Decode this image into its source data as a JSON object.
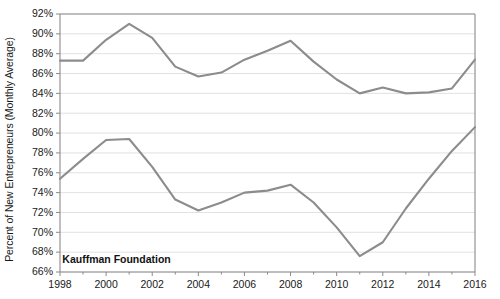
{
  "chart_data": {
    "type": "line",
    "title": "",
    "subtitle": "",
    "xlabel": "",
    "ylabel": "Percent of New Entrepreneurs (Monthly Average)",
    "xlim": [
      1998,
      2016
    ],
    "ylim": [
      66,
      92
    ],
    "ytick_step": 2,
    "xtick_step": 2,
    "grid": "horizontal",
    "legend_position": "none",
    "y_tick_labels": [
      "92%",
      "90%",
      "88%",
      "86%",
      "84%",
      "82%",
      "80%",
      "78%",
      "76%",
      "74%",
      "72%",
      "70%",
      "68%",
      "66%"
    ],
    "y_tick_values": [
      92,
      90,
      88,
      86,
      84,
      82,
      80,
      78,
      76,
      74,
      72,
      70,
      68,
      66
    ],
    "x_tick_labels": [
      "1998",
      "2000",
      "2002",
      "2004",
      "2006",
      "2008",
      "2010",
      "2012",
      "2014",
      "2016"
    ],
    "x_tick_values": [
      1998,
      2000,
      2002,
      2004,
      2006,
      2008,
      2010,
      2012,
      2014,
      2016
    ],
    "x": [
      1998,
      1999,
      2000,
      2001,
      2002,
      2003,
      2004,
      2005,
      2006,
      2007,
      2008,
      2009,
      2010,
      2011,
      2012,
      2013,
      2014,
      2015,
      2016
    ],
    "series": [
      {
        "name": "upper-series",
        "color": "#8c8c8c",
        "values": [
          87.3,
          87.3,
          89.4,
          91.0,
          89.6,
          86.7,
          85.7,
          86.1,
          87.4,
          88.3,
          89.3,
          87.2,
          85.4,
          84.0,
          84.6,
          84.0,
          84.1,
          84.5,
          87.4
        ]
      },
      {
        "name": "lower-series",
        "color": "#8c8c8c",
        "values": [
          75.4,
          77.4,
          79.3,
          79.4,
          76.6,
          73.3,
          72.2,
          73.0,
          74.0,
          74.2,
          74.8,
          73.0,
          70.5,
          67.6,
          69.0,
          72.4,
          75.4,
          78.2,
          80.6
        ]
      }
    ],
    "annotations": [
      {
        "name": "source-credit",
        "text": "Kauffman Foundation",
        "x": 1998.1,
        "y": 67.15
      }
    ],
    "colors": {
      "line": "#8c8c8c",
      "gridline": "#d9d9d9",
      "axis": "#8a8a8a",
      "text": "#1a1a1a",
      "background": "#ffffff"
    }
  }
}
